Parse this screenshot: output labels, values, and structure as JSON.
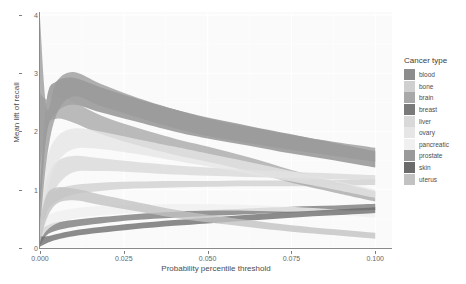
{
  "chart_data": {
    "type": "area",
    "title": "",
    "xlabel": "Probability percentile threshold",
    "ylabel": "Mean lift of recall",
    "xlim": [
      0.0,
      0.105
    ],
    "ylim": [
      0.0,
      4.05
    ],
    "xticks": [
      "0.000",
      "0.025",
      "0.050",
      "0.075",
      "0.100"
    ],
    "xtick_values": [
      0.0,
      0.025,
      0.05,
      0.075,
      0.1
    ],
    "yticks": [
      "0",
      "1",
      "2",
      "3",
      "4"
    ],
    "ytick_values": [
      0,
      1,
      2,
      3,
      4
    ],
    "grid": true,
    "legend_position": "right",
    "legend_title": "Cancer type",
    "band_description": "Each cancer type is drawn as a ribbon (mean lift of recall with an uncertainty band) versus probability percentile threshold.",
    "series": [
      {
        "name": "blood",
        "color": "#8c8c8c",
        "x": [
          0.0,
          0.002,
          0.005,
          0.01,
          0.018,
          0.028,
          0.04,
          0.05,
          0.062,
          0.075,
          0.088,
          0.1
        ],
        "lower": [
          0.55,
          1.95,
          2.33,
          2.46,
          2.33,
          2.18,
          2.0,
          1.88,
          1.76,
          1.62,
          1.5,
          1.38
        ],
        "upper": [
          1.0,
          2.55,
          2.86,
          2.92,
          2.76,
          2.58,
          2.38,
          2.24,
          2.1,
          1.95,
          1.8,
          1.66
        ],
        "mean": [
          0.78,
          2.25,
          2.6,
          2.69,
          2.55,
          2.38,
          2.19,
          2.06,
          1.93,
          1.79,
          1.65,
          1.52
        ]
      },
      {
        "name": "bone",
        "color": "#cfcfcf",
        "x": [
          0.0,
          0.002,
          0.005,
          0.01,
          0.018,
          0.028,
          0.04,
          0.05,
          0.062,
          0.075,
          0.088,
          0.1
        ],
        "lower": [
          0.2,
          0.62,
          0.8,
          0.92,
          0.98,
          1.02,
          1.04,
          1.05,
          1.06,
          1.06,
          1.07,
          1.08
        ],
        "upper": [
          0.42,
          0.86,
          1.0,
          1.08,
          1.12,
          1.14,
          1.15,
          1.15,
          1.16,
          1.16,
          1.17,
          1.18
        ],
        "mean": [
          0.31,
          0.74,
          0.9,
          1.0,
          1.05,
          1.08,
          1.1,
          1.1,
          1.11,
          1.11,
          1.12,
          1.13
        ]
      },
      {
        "name": "brain",
        "color": "#a8a8a8",
        "x": [
          0.0,
          0.002,
          0.005,
          0.01,
          0.018,
          0.028,
          0.04,
          0.05,
          0.062,
          0.075,
          0.088,
          0.1
        ],
        "lower": [
          1.4,
          2.08,
          2.22,
          2.15,
          1.96,
          1.78,
          1.6,
          1.48,
          1.32,
          1.12,
          0.95,
          0.8
        ],
        "upper": [
          2.65,
          2.55,
          2.6,
          2.5,
          2.28,
          2.08,
          1.88,
          1.74,
          1.56,
          1.34,
          1.14,
          0.97
        ],
        "mean": [
          2.02,
          2.32,
          2.41,
          2.33,
          2.12,
          1.93,
          1.74,
          1.61,
          1.44,
          1.23,
          1.05,
          0.88
        ]
      },
      {
        "name": "breast",
        "color": "#7a7a7a",
        "x": [
          0.0,
          0.002,
          0.005,
          0.01,
          0.018,
          0.028,
          0.04,
          0.05,
          0.062,
          0.075,
          0.088,
          0.1
        ],
        "lower": [
          0.05,
          0.22,
          0.3,
          0.36,
          0.42,
          0.48,
          0.52,
          0.55,
          0.58,
          0.61,
          0.63,
          0.65
        ],
        "upper": [
          0.3,
          0.38,
          0.44,
          0.48,
          0.53,
          0.58,
          0.62,
          0.65,
          0.68,
          0.71,
          0.73,
          0.76
        ],
        "mean": [
          0.17,
          0.3,
          0.37,
          0.42,
          0.47,
          0.53,
          0.57,
          0.6,
          0.63,
          0.66,
          0.68,
          0.7
        ]
      },
      {
        "name": "liver",
        "color": "#d9d9d9",
        "x": [
          0.0,
          0.002,
          0.005,
          0.01,
          0.018,
          0.028,
          0.04,
          0.05,
          0.062,
          0.075,
          0.088,
          0.1
        ],
        "lower": [
          0.1,
          0.6,
          1.05,
          1.3,
          1.32,
          1.3,
          1.26,
          1.24,
          1.22,
          1.2,
          1.18,
          1.16
        ],
        "upper": [
          0.55,
          1.18,
          1.48,
          1.58,
          1.54,
          1.48,
          1.42,
          1.38,
          1.34,
          1.31,
          1.28,
          1.25
        ],
        "mean": [
          0.32,
          0.89,
          1.26,
          1.44,
          1.43,
          1.39,
          1.34,
          1.31,
          1.28,
          1.25,
          1.23,
          1.2
        ]
      },
      {
        "name": "ovary",
        "color": "#e6e6e6",
        "x": [
          0.0,
          0.002,
          0.005,
          0.01,
          0.018,
          0.028,
          0.04,
          0.05,
          0.062,
          0.075,
          0.088,
          0.1
        ],
        "lower": [
          0.18,
          0.95,
          1.45,
          1.7,
          1.7,
          1.62,
          1.5,
          1.4,
          1.28,
          1.14,
          1.0,
          0.86
        ],
        "upper": [
          0.72,
          1.52,
          1.9,
          2.05,
          2.0,
          1.88,
          1.74,
          1.62,
          1.48,
          1.32,
          1.16,
          1.0
        ],
        "mean": [
          0.45,
          1.23,
          1.67,
          1.87,
          1.85,
          1.75,
          1.62,
          1.51,
          1.38,
          1.23,
          1.08,
          0.93
        ]
      },
      {
        "name": "pancreatic",
        "color": "#f0f0f0",
        "x": [
          0.0,
          0.002,
          0.005,
          0.01,
          0.018,
          0.028,
          0.04,
          0.05,
          0.062,
          0.075,
          0.088,
          0.1
        ],
        "lower": [
          0.12,
          0.3,
          0.42,
          0.5,
          0.56,
          0.6,
          0.63,
          0.64,
          0.64,
          0.62,
          0.58,
          0.52
        ],
        "upper": [
          0.44,
          0.54,
          0.62,
          0.68,
          0.72,
          0.74,
          0.75,
          0.75,
          0.74,
          0.71,
          0.66,
          0.6
        ],
        "mean": [
          0.28,
          0.42,
          0.52,
          0.59,
          0.64,
          0.67,
          0.69,
          0.7,
          0.69,
          0.66,
          0.62,
          0.56
        ]
      },
      {
        "name": "prostate",
        "color": "#9a9a9a",
        "x": [
          0.0,
          0.002,
          0.005,
          0.01,
          0.018,
          0.028,
          0.04,
          0.05,
          0.062,
          0.075,
          0.088,
          0.1
        ],
        "lower": [
          0.3,
          1.52,
          2.3,
          2.6,
          2.44,
          2.26,
          2.06,
          1.92,
          1.8,
          1.68,
          1.58,
          1.48
        ],
        "upper": [
          3.95,
          2.4,
          2.86,
          3.02,
          2.82,
          2.6,
          2.38,
          2.22,
          2.08,
          1.94,
          1.82,
          1.72
        ],
        "mean": [
          2.12,
          1.96,
          2.58,
          2.81,
          2.63,
          2.43,
          2.22,
          2.07,
          1.94,
          1.81,
          1.7,
          1.6
        ]
      },
      {
        "name": "skin",
        "color": "#6b6b6b",
        "x": [
          0.0,
          0.002,
          0.005,
          0.01,
          0.018,
          0.028,
          0.04,
          0.05,
          0.062,
          0.075,
          0.088,
          0.1
        ],
        "lower": [
          0.02,
          0.08,
          0.14,
          0.2,
          0.26,
          0.32,
          0.38,
          0.42,
          0.47,
          0.52,
          0.56,
          0.6
        ],
        "upper": [
          0.2,
          0.2,
          0.24,
          0.3,
          0.36,
          0.42,
          0.48,
          0.52,
          0.57,
          0.62,
          0.66,
          0.7
        ],
        "mean": [
          0.11,
          0.14,
          0.19,
          0.25,
          0.31,
          0.37,
          0.43,
          0.47,
          0.52,
          0.57,
          0.61,
          0.65
        ]
      },
      {
        "name": "uterus",
        "color": "#c2c2c2",
        "x": [
          0.0,
          0.002,
          0.005,
          0.01,
          0.018,
          0.028,
          0.04,
          0.05,
          0.062,
          0.075,
          0.088,
          0.1
        ],
        "lower": [
          0.08,
          0.5,
          0.76,
          0.82,
          0.74,
          0.64,
          0.52,
          0.44,
          0.36,
          0.28,
          0.22,
          0.16
        ],
        "upper": [
          0.5,
          0.92,
          1.04,
          1.02,
          0.92,
          0.8,
          0.66,
          0.57,
          0.48,
          0.39,
          0.32,
          0.26
        ],
        "mean": [
          0.29,
          0.71,
          0.9,
          0.92,
          0.83,
          0.72,
          0.59,
          0.5,
          0.42,
          0.34,
          0.27,
          0.21
        ]
      }
    ]
  },
  "panel": {
    "background_color": "#fafafa",
    "grid_color": "#ffffff",
    "axis_color": "#8a8a8a"
  },
  "legend": {
    "title": "Cancer type",
    "items": [
      {
        "label": "blood",
        "color": "#8c8c8c"
      },
      {
        "label": "bone",
        "color": "#cfcfcf"
      },
      {
        "label": "brain",
        "color": "#a8a8a8"
      },
      {
        "label": "breast",
        "color": "#7a7a7a"
      },
      {
        "label": "liver",
        "color": "#d9d9d9"
      },
      {
        "label": "ovary",
        "color": "#e6e6e6"
      },
      {
        "label": "pancreatic",
        "color": "#f0f0f0"
      },
      {
        "label": "prostate",
        "color": "#9a9a9a"
      },
      {
        "label": "skin",
        "color": "#6b6b6b"
      },
      {
        "label": "uterus",
        "color": "#c2c2c2"
      }
    ]
  }
}
